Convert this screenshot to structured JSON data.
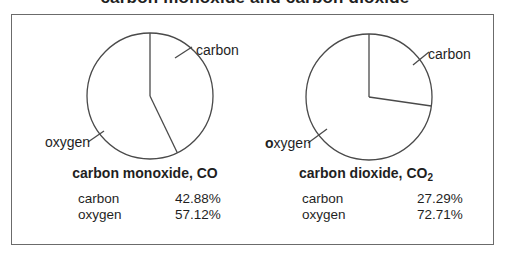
{
  "page": {
    "top_title": "carbon monoxide and carbon dioxide"
  },
  "colors": {
    "line": "#4a4a4a",
    "text": "#1f1f1f",
    "box_border": "#6b6b6b"
  },
  "chart_data": [
    {
      "type": "pie",
      "title_main": "carbon monoxide, CO",
      "title_sub": "",
      "start_angle_deg": 0,
      "legend_position": "callouts-outside",
      "slices": [
        {
          "label": "carbon",
          "pct": 42.88,
          "display": "42.88%"
        },
        {
          "label": "oxygen",
          "pct": 57.12,
          "display": "57.12%"
        }
      ]
    },
    {
      "type": "pie",
      "title_main": "carbon dioxide, CO",
      "title_sub": "2",
      "start_angle_deg": 0,
      "legend_position": "callouts-outside",
      "slices": [
        {
          "label": "carbon",
          "pct": 27.29,
          "display": "27.29%"
        },
        {
          "label": "oxygen",
          "pct": 72.71,
          "display": "72.71%"
        }
      ]
    }
  ]
}
